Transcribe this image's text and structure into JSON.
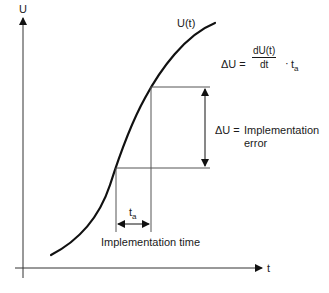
{
  "diagram": {
    "axes": {
      "y_label": "U",
      "x_label": "t"
    },
    "curve_label": "U(t)",
    "formula": {
      "lhs": "ΔU =",
      "numerator": "dU(t)",
      "denominator": "dt",
      "times": "·",
      "factor": "t",
      "factor_subscript": "a"
    },
    "delta_u_annotation": {
      "lhs": "ΔU =",
      "line1": "Implementation",
      "line2": "error"
    },
    "time_annotation": {
      "symbol": "t",
      "symbol_subscript": "a",
      "label": "Implementation time"
    },
    "colors": {
      "curve": "#111111",
      "guide_lines": "#555555",
      "axes": "#333333",
      "text": "#1a1a1a"
    }
  }
}
